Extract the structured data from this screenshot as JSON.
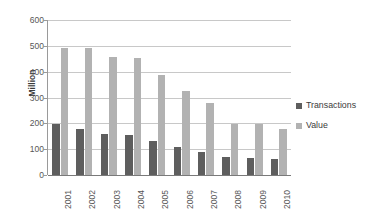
{
  "chart_data": {
    "type": "bar",
    "title": "",
    "xlabel": "",
    "ylabel": "Million",
    "ylim": [
      0,
      600
    ],
    "ytick_step": 100,
    "yticks": [
      600,
      500,
      400,
      300,
      200,
      100,
      0
    ],
    "grid": true,
    "legend_position": "right",
    "categories": [
      "2001",
      "2002",
      "2003",
      "2004",
      "2005",
      "2006",
      "2007",
      "2008",
      "2009",
      "2010"
    ],
    "series": [
      {
        "name": "Transactions",
        "color": "#5e5e5e",
        "values": [
          198,
          180,
          157,
          155,
          130,
          107,
          90,
          70,
          67,
          61
        ]
      },
      {
        "name": "Value",
        "color": "#b2b2b2",
        "values": [
          493,
          490,
          455,
          454,
          389,
          325,
          278,
          199,
          198,
          180
        ]
      }
    ]
  },
  "legend": {
    "items": [
      {
        "label": "Transactions",
        "color": "#5e5e5e"
      },
      {
        "label": "Value",
        "color": "#b2b2b2"
      }
    ]
  },
  "axes": {
    "y_title": "Million"
  },
  "colors": {
    "transactions": "#5e5e5e",
    "value": "#b2b2b2",
    "gridline": "#c8c8c8",
    "axis": "#9a9a9a",
    "baseline": "#7a7a7a",
    "text": "#3b3b3b",
    "tick_text": "#575757",
    "background": "#ffffff"
  }
}
